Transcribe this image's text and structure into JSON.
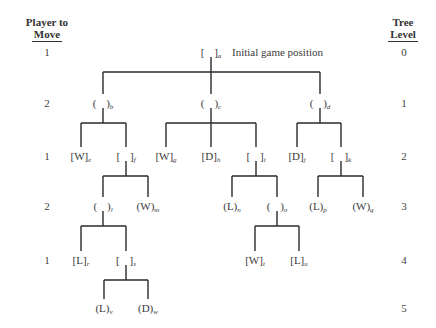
{
  "headers": {
    "player_to_move": [
      "Player to",
      "Move"
    ],
    "tree_level": [
      "Tree",
      "Level"
    ]
  },
  "rows": [
    {
      "level": "0",
      "player": "1",
      "y": 52
    },
    {
      "level": "1",
      "player": "2",
      "y": 103
    },
    {
      "level": "2",
      "player": "1",
      "y": 156
    },
    {
      "level": "3",
      "player": "2",
      "y": 206
    },
    {
      "level": "4",
      "player": "1",
      "y": 260
    },
    {
      "level": "5",
      "player": "",
      "y": 308
    }
  ],
  "root_annotation": "Initial game position",
  "nodes": [
    {
      "id": "a",
      "open": "[",
      "close": "]",
      "value": "",
      "x": 211,
      "y": 52
    },
    {
      "id": "b",
      "open": "(",
      "close": ")",
      "value": "",
      "x": 103,
      "y": 103
    },
    {
      "id": "c",
      "open": "(",
      "close": ")",
      "value": "",
      "x": 211,
      "y": 103
    },
    {
      "id": "d",
      "open": "(",
      "close": ")",
      "value": "",
      "x": 320,
      "y": 103
    },
    {
      "id": "e",
      "open": "[",
      "close": "]",
      "value": "W",
      "x": 81,
      "y": 156
    },
    {
      "id": "f",
      "open": "[",
      "close": "]",
      "value": "",
      "x": 126,
      "y": 156
    },
    {
      "id": "g",
      "open": "[",
      "close": "]",
      "value": "W",
      "x": 166,
      "y": 156
    },
    {
      "id": "h",
      "open": "[",
      "close": "]",
      "value": "D",
      "x": 211,
      "y": 156
    },
    {
      "id": "i",
      "open": "[",
      "close": "]",
      "value": "",
      "x": 256,
      "y": 156
    },
    {
      "id": "j",
      "open": "[",
      "close": "]",
      "value": "D",
      "x": 297,
      "y": 156
    },
    {
      "id": "k",
      "open": "[",
      "close": "]",
      "value": "",
      "x": 341,
      "y": 156
    },
    {
      "id": "l",
      "open": "(",
      "close": ")",
      "value": "",
      "x": 103,
      "y": 206
    },
    {
      "id": "m",
      "open": "(",
      "close": ")",
      "value": "W",
      "x": 148,
      "y": 206
    },
    {
      "id": "n",
      "open": "(",
      "close": ")",
      "value": "L",
      "x": 232,
      "y": 206
    },
    {
      "id": "o",
      "open": "(",
      "close": ")",
      "value": "",
      "x": 277,
      "y": 206
    },
    {
      "id": "p",
      "open": "(",
      "close": ")",
      "value": "L",
      "x": 318,
      "y": 206
    },
    {
      "id": "q",
      "open": "(",
      "close": ")",
      "value": "W",
      "x": 363,
      "y": 206
    },
    {
      "id": "r",
      "open": "[",
      "close": "]",
      "value": "L",
      "x": 81,
      "y": 260
    },
    {
      "id": "s",
      "open": "[",
      "close": "]",
      "value": "",
      "x": 126,
      "y": 260
    },
    {
      "id": "t",
      "open": "[",
      "close": "]",
      "value": "W",
      "x": 255,
      "y": 260
    },
    {
      "id": "u",
      "open": "[",
      "close": "]",
      "value": "L",
      "x": 299,
      "y": 260
    },
    {
      "id": "v",
      "open": "(",
      "close": ")",
      "value": "L",
      "x": 104,
      "y": 308
    },
    {
      "id": "w",
      "open": "(",
      "close": ")",
      "value": "D",
      "x": 148,
      "y": 308
    }
  ],
  "edges": [
    {
      "parent": "a",
      "children": [
        "b",
        "c",
        "d"
      ]
    },
    {
      "parent": "b",
      "children": [
        "e",
        "f"
      ]
    },
    {
      "parent": "c",
      "children": [
        "g",
        "h",
        "i"
      ]
    },
    {
      "parent": "d",
      "children": [
        "j",
        "k"
      ]
    },
    {
      "parent": "f",
      "children": [
        "l",
        "m"
      ]
    },
    {
      "parent": "i",
      "children": [
        "n",
        "o"
      ]
    },
    {
      "parent": "k",
      "children": [
        "p",
        "q"
      ]
    },
    {
      "parent": "l",
      "children": [
        "r",
        "s"
      ]
    },
    {
      "parent": "o",
      "children": [
        "t",
        "u"
      ]
    },
    {
      "parent": "s",
      "children": [
        "v",
        "w"
      ]
    }
  ]
}
